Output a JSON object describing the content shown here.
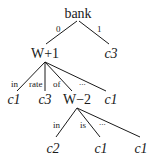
{
  "tree": {
    "root": {
      "label": "bank"
    },
    "level1": {
      "edges": [
        {
          "label": "0"
        },
        {
          "label": "1"
        }
      ],
      "nodes": [
        {
          "label": "W+1"
        },
        {
          "label": "c3"
        }
      ]
    },
    "level2": {
      "edges": [
        {
          "label": "in"
        },
        {
          "label": "rate"
        },
        {
          "label": "of"
        },
        {
          "label": "..."
        }
      ],
      "nodes": [
        {
          "label": "c1"
        },
        {
          "label": "c3"
        },
        {
          "label": "W−2"
        },
        {
          "label": "c1"
        }
      ]
    },
    "level3": {
      "edges": [
        {
          "label": "in"
        },
        {
          "label": "is"
        },
        {
          "label": "..."
        }
      ],
      "nodes": [
        {
          "label": "c2"
        },
        {
          "label": "c1"
        },
        {
          "label": "c1"
        }
      ]
    }
  }
}
